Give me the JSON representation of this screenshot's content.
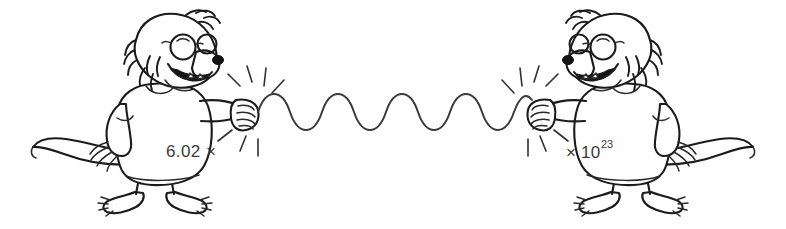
{
  "image": {
    "title": "Avogadro's number handshake cartoon",
    "description": "Two mirrored cartoon mole characters wearing glasses and t-shirts shake hands across a long wavy line; their shirts together spell out Avogadro's number.",
    "style": "black and white hand-drawn line art",
    "background_color": "#ffffff",
    "ink_color": "#1b1b1b",
    "width": 786,
    "height": 229
  },
  "characters": {
    "left": {
      "name": "left-mole-character",
      "facing": "right",
      "shirt_text_main": "6.02",
      "shirt_text_operator": "×",
      "features": [
        "round-glasses",
        "spiky-head-fur",
        "dark-nose",
        "open-smiling-mouth",
        "long-curving-tail",
        "clawed-feet",
        "short-sleeve-tshirt"
      ]
    },
    "right": {
      "name": "right-mole-character",
      "facing": "left",
      "shirt_text_operator": "×",
      "shirt_text_base": "10",
      "shirt_text_exponent": "23",
      "features": [
        "round-glasses",
        "spiky-head-fur",
        "dark-nose",
        "open-smiling-mouth",
        "long-curving-tail",
        "clawed-feet",
        "short-sleeve-tshirt"
      ]
    }
  },
  "connector": {
    "name": "wavy-handshake-line",
    "type": "sine-wave",
    "cycles": 6,
    "color": "#3a3a3a"
  },
  "effects": {
    "left_sparkle_name": "left-handshake-sparkle",
    "right_sparkle_name": "right-handshake-sparkle",
    "sparkle_rays": 7
  },
  "full_expression": "6.02 × 10²³"
}
